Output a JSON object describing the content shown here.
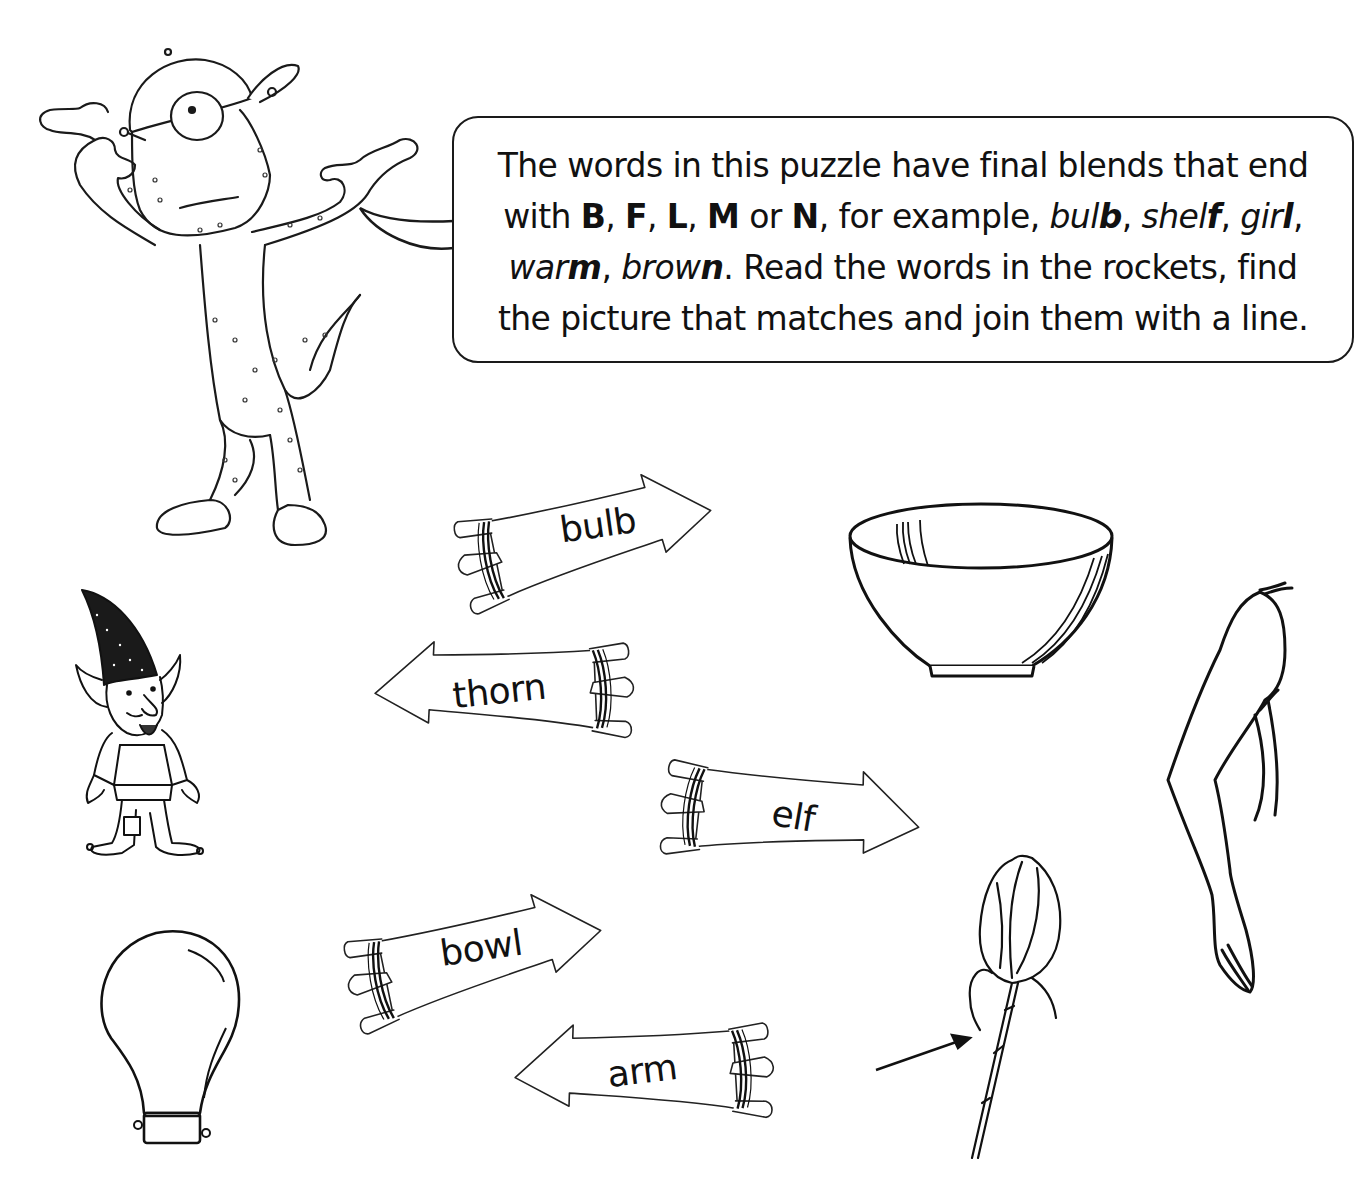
{
  "instructions": {
    "line1": "The words in this puzzle have final blends that end",
    "line2_parts": [
      {
        "text": "with ",
        "style": "normal"
      },
      {
        "text": "B",
        "style": "bold"
      },
      {
        "text": ", ",
        "style": "normal"
      },
      {
        "text": "F",
        "style": "bold"
      },
      {
        "text": ", ",
        "style": "normal"
      },
      {
        "text": "L",
        "style": "bold"
      },
      {
        "text": ", ",
        "style": "normal"
      },
      {
        "text": "M",
        "style": "bold"
      },
      {
        "text": " or ",
        "style": "normal"
      },
      {
        "text": "N",
        "style": "bold"
      },
      {
        "text": ", for example, ",
        "style": "normal"
      }
    ],
    "examples": [
      {
        "stem": "bul",
        "ending": "b"
      },
      {
        "stem": "shel",
        "ending": "f"
      },
      {
        "stem": "gir",
        "ending": "l"
      },
      {
        "stem": "war",
        "ending": "m"
      },
      {
        "stem": "brow",
        "ending": "n"
      }
    ],
    "line3_tail": ". Read the words in the rockets, find",
    "line4": "the picture that matches and join them with a line.",
    "blend_letters": [
      "B",
      "F",
      "L",
      "M",
      "N"
    ]
  },
  "rockets": [
    {
      "word": "bulb",
      "direction": "right"
    },
    {
      "word": "thorn",
      "direction": "left"
    },
    {
      "word": "elf",
      "direction": "right"
    },
    {
      "word": "bowl",
      "direction": "right"
    },
    {
      "word": "arm",
      "direction": "left"
    }
  ],
  "pictures": [
    {
      "id": "monster",
      "label": "one-eyed monster mascot"
    },
    {
      "id": "elf",
      "label": "elf"
    },
    {
      "id": "bulb",
      "label": "light bulb"
    },
    {
      "id": "bowl",
      "label": "bowl"
    },
    {
      "id": "arm",
      "label": "arm"
    },
    {
      "id": "thorn",
      "label": "rose with arrow pointing to thorn"
    }
  ],
  "colors": {
    "ink": "#111111",
    "paper": "#ffffff"
  }
}
